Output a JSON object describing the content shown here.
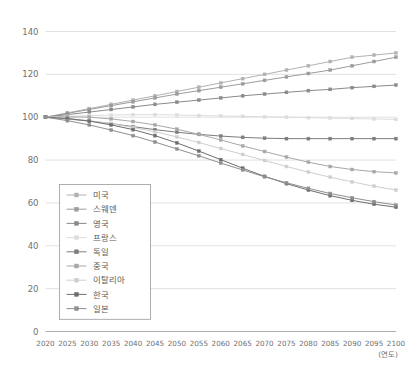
{
  "chart_data": {
    "type": "line",
    "title": "",
    "subtitle": "",
    "xlabel": "(연도)",
    "ylabel": "",
    "xlim": [
      2020,
      2100
    ],
    "ylim": [
      0,
      140
    ],
    "ytick_step": 20,
    "grid": true,
    "legend_position": "inside-lower-left",
    "index_base": 100,
    "x": [
      2020,
      2025,
      2030,
      2035,
      2040,
      2045,
      2050,
      2055,
      2060,
      2065,
      2070,
      2075,
      2080,
      2085,
      2090,
      2095,
      2100
    ],
    "xtick_labels": [
      "2020",
      "2025",
      "2030",
      "2035",
      "2040",
      "2045",
      "2050",
      "2055",
      "2060",
      "2065",
      "2070",
      "2075",
      "2080",
      "2085",
      "2090",
      "2095",
      "2100"
    ],
    "ytick_labels": [
      "0",
      "20",
      "40",
      "60",
      "80",
      "100",
      "120",
      "140"
    ],
    "series": [
      {
        "name": "미국",
        "color": "#b2b2b2",
        "values": [
          100,
          102.0,
          104.0,
          106.0,
          108.0,
          110.0,
          112.0,
          114.0,
          116.0,
          118.0,
          120.0,
          122.0,
          124.0,
          126.0,
          128.0,
          129.0,
          130.0
        ]
      },
      {
        "name": "스웨덴",
        "color": "#9c9c9c",
        "values": [
          100,
          101.8,
          103.6,
          105.4,
          107.2,
          109.0,
          110.8,
          112.4,
          114.0,
          115.6,
          117.2,
          118.8,
          120.4,
          122.0,
          124.0,
          126.0,
          128.0
        ]
      },
      {
        "name": "영국",
        "color": "#8a8a8a",
        "values": [
          100,
          101.2,
          102.4,
          103.6,
          104.8,
          106.0,
          107.0,
          108.0,
          109.0,
          110.0,
          110.8,
          111.6,
          112.4,
          113.0,
          113.8,
          114.4,
          115.0
        ]
      },
      {
        "name": "프랑스",
        "color": "#dcdcdc",
        "values": [
          100,
          100.4,
          100.8,
          101.0,
          101.2,
          101.2,
          101.0,
          100.8,
          100.6,
          100.4,
          100.2,
          100.0,
          99.8,
          99.6,
          99.4,
          99.2,
          99.0
        ]
      },
      {
        "name": "독일",
        "color": "#7d7d7d",
        "values": [
          100,
          99.2,
          98.2,
          97.0,
          95.6,
          94.2,
          93.0,
          92.0,
          91.2,
          90.6,
          90.2,
          90.0,
          90.0,
          90.0,
          90.0,
          90.0,
          90.0
        ]
      },
      {
        "name": "중국",
        "color": "#a8a8a8",
        "values": [
          100,
          100.2,
          100.0,
          99.2,
          98.0,
          96.4,
          94.4,
          92.0,
          89.4,
          86.6,
          84.0,
          81.4,
          79.0,
          77.0,
          75.6,
          74.6,
          74.0
        ]
      },
      {
        "name": "이탈리아",
        "color": "#cfcfcf",
        "values": [
          100,
          99.4,
          98.4,
          97.0,
          95.2,
          93.2,
          90.8,
          88.2,
          85.4,
          82.6,
          79.8,
          77.0,
          74.4,
          72.0,
          69.8,
          67.8,
          66.0
        ]
      },
      {
        "name": "한국",
        "color": "#6e6e6e",
        "values": [
          100,
          99.4,
          98.2,
          96.4,
          94.2,
          91.4,
          88.0,
          84.2,
          80.2,
          76.2,
          72.4,
          69.0,
          66.0,
          63.4,
          61.2,
          59.4,
          58.0
        ]
      },
      {
        "name": "일본",
        "color": "#8f8f8f",
        "values": [
          100,
          98.4,
          96.4,
          94.0,
          91.4,
          88.4,
          85.2,
          82.0,
          78.6,
          75.4,
          72.2,
          69.4,
          66.8,
          64.4,
          62.4,
          60.6,
          59.0
        ]
      }
    ]
  },
  "legend": {
    "items": [
      "미국",
      "스웨덴",
      "영국",
      "프랑스",
      "독일",
      "중국",
      "이탈리아",
      "한국",
      "일본"
    ]
  },
  "axis": {
    "x_unit_label": "(연도)"
  }
}
